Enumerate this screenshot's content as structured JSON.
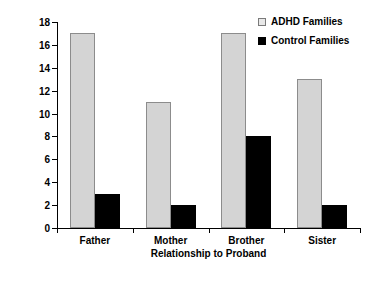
{
  "chart_data": {
    "type": "bar",
    "title": "",
    "xlabel": "Relationship to Proband",
    "ylabel": "% with ADHD",
    "categories": [
      "Father",
      "Mother",
      "Brother",
      "Sister"
    ],
    "series": [
      {
        "name": "ADHD Families",
        "values": [
          17,
          11,
          17,
          13
        ],
        "color": "#d4d4d4"
      },
      {
        "name": "Control Families",
        "values": [
          3,
          2,
          8,
          2
        ],
        "color": "#000000"
      }
    ],
    "ylim": [
      0,
      18
    ],
    "ytick_step": 2,
    "yticks": [
      0,
      2,
      4,
      6,
      8,
      10,
      12,
      14,
      16,
      18
    ],
    "grid": false,
    "legend_position": "top-right"
  },
  "legend": {
    "items": [
      {
        "label": "ADHD Families"
      },
      {
        "label": "Control Families"
      }
    ]
  },
  "axes": {
    "y_title": "% with ADHD",
    "x_title": "Relationship to Proband"
  }
}
